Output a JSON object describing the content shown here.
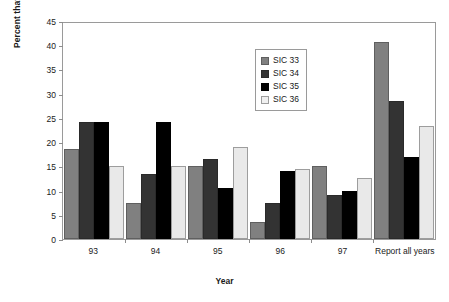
{
  "chart_data": {
    "type": "bar",
    "title": "",
    "xlabel": "Year",
    "ylabel": "Percent that stopped reporting",
    "categories": [
      "93",
      "94",
      "95",
      "96",
      "97",
      "Report all years"
    ],
    "ylim": [
      0,
      45
    ],
    "yticks": [
      0,
      5,
      10,
      15,
      20,
      25,
      30,
      35,
      40,
      45
    ],
    "grid": false,
    "legend_position": "inside-top-right",
    "series": [
      {
        "name": "SIC 33",
        "color": "#808080",
        "values": [
          18.6,
          7.5,
          15.0,
          3.5,
          15.0,
          40.7
        ]
      },
      {
        "name": "SIC 34",
        "color": "#333333",
        "values": [
          24.2,
          13.5,
          16.5,
          7.5,
          9.0,
          28.5
        ]
      },
      {
        "name": "SIC 35",
        "color": "#000000",
        "values": [
          24.2,
          24.1,
          10.5,
          14.0,
          10.0,
          17.0
        ]
      },
      {
        "name": "SIC 36",
        "color": "#e9e9e9",
        "values": [
          15.0,
          15.0,
          19.0,
          14.5,
          12.5,
          23.3
        ]
      }
    ]
  }
}
